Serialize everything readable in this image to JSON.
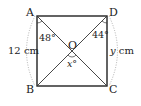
{
  "diagram": {
    "type": "geometry-rectangle",
    "vertices": {
      "A": {
        "label": "A",
        "x": 37,
        "y": 16
      },
      "D": {
        "label": "D",
        "x": 107,
        "y": 16
      },
      "B": {
        "label": "B",
        "x": 37,
        "y": 86
      },
      "C": {
        "label": "C",
        "x": 107,
        "y": 86
      }
    },
    "center": {
      "label": "O",
      "x": 72,
      "y": 51
    },
    "angles": {
      "angle_A": "48°",
      "angle_D": "44°",
      "angle_O": "x°"
    },
    "measurements": {
      "left_side": "12 cm",
      "right_side_var": "y",
      "right_side_unit": " cm"
    },
    "colors": {
      "line": "#222222",
      "dotted": "#999999",
      "background": "#ffffff"
    }
  }
}
